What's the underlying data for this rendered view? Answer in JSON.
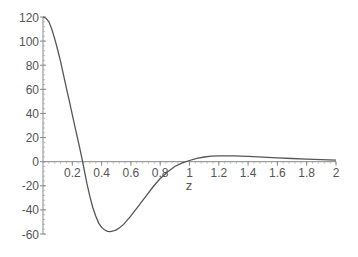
{
  "chart_data": {
    "type": "line",
    "title": "",
    "xlabel": "z",
    "ylabel": "",
    "xlim": [
      0,
      2
    ],
    "ylim": [
      -60,
      120
    ],
    "grid": false,
    "legend": null,
    "x_ticks": [
      "0.2",
      "0.4",
      "0.6",
      "0.8",
      "1",
      "1.2",
      "1.4",
      "1.6",
      "1.8",
      "2"
    ],
    "x_tick_values": [
      0.2,
      0.4,
      0.6,
      0.8,
      1.0,
      1.2,
      1.4,
      1.6,
      1.8,
      2.0
    ],
    "y_ticks": [
      "120",
      "100",
      "80",
      "60",
      "40",
      "20",
      "0",
      "-20",
      "-40",
      "-60"
    ],
    "y_tick_values": [
      120,
      100,
      80,
      60,
      40,
      20,
      0,
      -20,
      -40,
      -60
    ],
    "series": [
      {
        "name": "f(z)",
        "color": "#555555",
        "x": [
          0,
          0.02,
          0.04,
          0.06,
          0.08,
          0.1,
          0.12,
          0.14,
          0.16,
          0.18,
          0.2,
          0.22,
          0.24,
          0.26,
          0.27,
          0.28,
          0.3,
          0.32,
          0.34,
          0.36,
          0.38,
          0.4,
          0.42,
          0.44,
          0.46,
          0.48,
          0.5,
          0.52,
          0.55,
          0.6,
          0.65,
          0.7,
          0.75,
          0.8,
          0.85,
          0.9,
          0.95,
          1.0,
          1.05,
          1.1,
          1.15,
          1.2,
          1.25,
          1.3,
          1.4,
          1.5,
          1.6,
          1.7,
          1.8,
          1.9,
          2.0
        ],
        "values": [
          120,
          119,
          116,
          110,
          102,
          93,
          83,
          72,
          61,
          50,
          39,
          28,
          17,
          6,
          0,
          -6,
          -18,
          -29,
          -38,
          -45,
          -51,
          -54.5,
          -56.5,
          -57.8,
          -58,
          -57.5,
          -56.5,
          -55,
          -52,
          -45,
          -37,
          -29,
          -21,
          -14,
          -8.5,
          -4,
          -1,
          1,
          2.8,
          3.9,
          4.5,
          4.8,
          4.9,
          4.8,
          4.4,
          3.8,
          3.2,
          2.6,
          2.1,
          1.6,
          1.2
        ]
      }
    ]
  },
  "axes": {
    "x_axis_label": "z"
  }
}
